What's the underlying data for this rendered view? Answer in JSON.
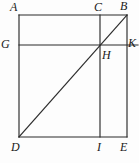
{
  "figure": {
    "kind": "geometry-diagram",
    "stroke_color": "#2b2b2b",
    "background_color": "#fdfdfd",
    "label_color": "#1a1a1a",
    "canvas": {
      "width": 139,
      "height": 163
    },
    "square": {
      "left": 19,
      "right": 127,
      "top": 15,
      "bottom": 137
    },
    "segments": [
      {
        "name": "top-edge-A-B",
        "x1": 19,
        "y1": 15,
        "x2": 127,
        "y2": 15
      },
      {
        "name": "left-edge-A-D",
        "x1": 19,
        "y1": 15,
        "x2": 19,
        "y2": 137
      },
      {
        "name": "right-edge-B-E",
        "x1": 127,
        "y1": 15,
        "x2": 127,
        "y2": 137
      },
      {
        "name": "bottom-edge-D-E",
        "x1": 19,
        "y1": 137,
        "x2": 127,
        "y2": 137
      },
      {
        "name": "horizontal-G-K",
        "x1": 19,
        "y1": 45,
        "x2": 138,
        "y2": 45
      },
      {
        "name": "vertical-C-I",
        "x1": 100,
        "y1": 15,
        "x2": 100,
        "y2": 137
      },
      {
        "name": "diagonal-D-B",
        "x1": 19,
        "y1": 137,
        "x2": 127,
        "y2": 15
      }
    ],
    "points": [
      {
        "id": "A",
        "label": "A",
        "px": 19,
        "py": 15,
        "label_x": 10,
        "label_y": 1
      },
      {
        "id": "C",
        "label": "C",
        "px": 100,
        "py": 15,
        "label_x": 94,
        "label_y": 1
      },
      {
        "id": "B",
        "label": "B",
        "px": 127,
        "py": 15,
        "label_x": 120,
        "label_y": 0
      },
      {
        "id": "G",
        "label": "G",
        "px": 19,
        "py": 45,
        "label_x": 1,
        "label_y": 38
      },
      {
        "id": "H",
        "label": "H",
        "px": 100,
        "py": 45,
        "label_x": 102,
        "label_y": 49
      },
      {
        "id": "K",
        "label": "K",
        "px": 137,
        "py": 45,
        "label_x": 128,
        "label_y": 37
      },
      {
        "id": "D",
        "label": "D",
        "px": 19,
        "py": 137,
        "label_x": 11,
        "label_y": 141
      },
      {
        "id": "I",
        "label": "I",
        "px": 100,
        "py": 137,
        "label_x": 97,
        "label_y": 141
      },
      {
        "id": "E",
        "label": "E",
        "px": 127,
        "py": 137,
        "label_x": 120,
        "label_y": 141
      }
    ]
  }
}
